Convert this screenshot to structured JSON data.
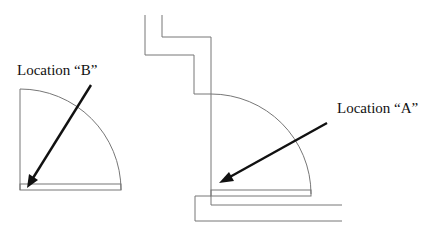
{
  "diagram": {
    "type": "door-swing floor plan",
    "labels": [
      {
        "id": "B",
        "text": "Location “B”"
      },
      {
        "id": "A",
        "text": "Location “A”"
      }
    ],
    "colors": {
      "line": "#777777",
      "arrow": "#111111",
      "background": "#ffffff"
    }
  }
}
